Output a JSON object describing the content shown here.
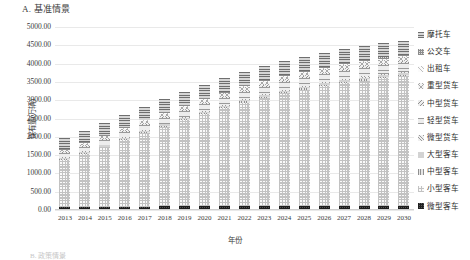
{
  "panel": {
    "title": "A. 基准情景"
  },
  "axes": {
    "ylabel": "保有量(万辆)",
    "xlabel": "年份",
    "yticks": [
      "5000.00",
      "4500.00",
      "4000.00",
      "3500.00",
      "3000.00",
      "2500.00",
      "2000.00",
      "1500.00",
      "1000.00",
      "500.00",
      "0.00"
    ]
  },
  "footnote": "B. 政策情景",
  "legend": {
    "items": [
      {
        "label": "摩托车",
        "pattern": "p-moto"
      },
      {
        "label": "公交车",
        "pattern": "p-bus"
      },
      {
        "label": "出租车",
        "pattern": "p-taxi"
      },
      {
        "label": "重型货车",
        "pattern": "p-hgv"
      },
      {
        "label": "中型货车",
        "pattern": "p-mgv"
      },
      {
        "label": "轻型货车",
        "pattern": "p-lgv"
      },
      {
        "label": "微型货车",
        "pattern": "p-mingv"
      },
      {
        "label": "大型客车",
        "pattern": "p-lbus"
      },
      {
        "label": "中型客车",
        "pattern": "p-mbus"
      },
      {
        "label": "小型客车",
        "pattern": "p-sbus"
      },
      {
        "label": "微型客车",
        "pattern": "p-minibus"
      }
    ]
  },
  "chart_data": {
    "type": "bar",
    "stacked": true,
    "title": "A. 基准情景",
    "xlabel": "年份",
    "ylabel": "保有量(万辆)",
    "ylim": [
      0,
      5000
    ],
    "ytick_step": 500,
    "grid": true,
    "legend_position": "right",
    "categories": [
      "2013",
      "2014",
      "2015",
      "2016",
      "2017",
      "2018",
      "2019",
      "2020",
      "2021",
      "2022",
      "2023",
      "2024",
      "2025",
      "2026",
      "2027",
      "2028",
      "2029",
      "2030"
    ],
    "series": [
      {
        "name": "微型客车",
        "pattern": "p-minibus",
        "values": [
          60,
          62,
          64,
          66,
          68,
          70,
          72,
          74,
          76,
          78,
          80,
          82,
          84,
          86,
          88,
          90,
          92,
          94
        ]
      },
      {
        "name": "小型客车",
        "pattern": "p-sbus",
        "values": [
          1280,
          1440,
          1620,
          1810,
          2000,
          2180,
          2350,
          2520,
          2680,
          2830,
          2960,
          3080,
          3180,
          3270,
          3350,
          3420,
          3480,
          3530
        ]
      },
      {
        "name": "中型客车",
        "pattern": "p-mbus",
        "values": [
          22,
          23,
          24,
          25,
          26,
          27,
          28,
          29,
          30,
          31,
          32,
          33,
          34,
          35,
          36,
          37,
          38,
          39
        ]
      },
      {
        "name": "大型客车",
        "pattern": "p-lbus",
        "values": [
          30,
          31,
          32,
          33,
          34,
          35,
          36,
          37,
          38,
          39,
          40,
          41,
          42,
          43,
          44,
          45,
          46,
          47
        ]
      },
      {
        "name": "微型货车",
        "pattern": "p-mingv",
        "values": [
          18,
          19,
          20,
          21,
          22,
          23,
          24,
          25,
          26,
          27,
          28,
          29,
          30,
          31,
          32,
          33,
          34,
          35
        ]
      },
      {
        "name": "轻型货车",
        "pattern": "p-lgv",
        "values": [
          120,
          128,
          136,
          145,
          154,
          163,
          172,
          181,
          190,
          198,
          206,
          213,
          220,
          226,
          232,
          237,
          242,
          246
        ]
      },
      {
        "name": "中型货车",
        "pattern": "p-mgv",
        "values": [
          26,
          27,
          28,
          29,
          30,
          31,
          32,
          33,
          34,
          35,
          36,
          37,
          38,
          39,
          40,
          41,
          42,
          43
        ]
      },
      {
        "name": "重型货车",
        "pattern": "p-hgv",
        "values": [
          56,
          60,
          64,
          68,
          72,
          76,
          80,
          84,
          88,
          92,
          95,
          98,
          101,
          104,
          106,
          108,
          110,
          112
        ]
      },
      {
        "name": "出租车",
        "pattern": "p-taxi",
        "values": [
          14,
          15,
          16,
          17,
          18,
          19,
          20,
          21,
          22,
          23,
          24,
          25,
          26,
          27,
          28,
          29,
          30,
          31
        ]
      },
      {
        "name": "公交车",
        "pattern": "p-bus",
        "values": [
          16,
          17,
          18,
          19,
          20,
          21,
          22,
          23,
          24,
          25,
          26,
          27,
          28,
          29,
          30,
          31,
          32,
          33
        ]
      },
      {
        "name": "摩托车",
        "pattern": "p-moto",
        "values": [
          310,
          318,
          326,
          334,
          342,
          350,
          356,
          362,
          368,
          372,
          376,
          380,
          382,
          384,
          386,
          388,
          390,
          392
        ]
      }
    ],
    "totals": [
      1952,
      2140,
      2348,
      2568,
      2786,
      2995,
      3192,
      3389,
      3576,
      3750,
      3903,
      4043,
      4165,
      4273,
      4372,
      4459,
      4536,
      4602
    ]
  }
}
